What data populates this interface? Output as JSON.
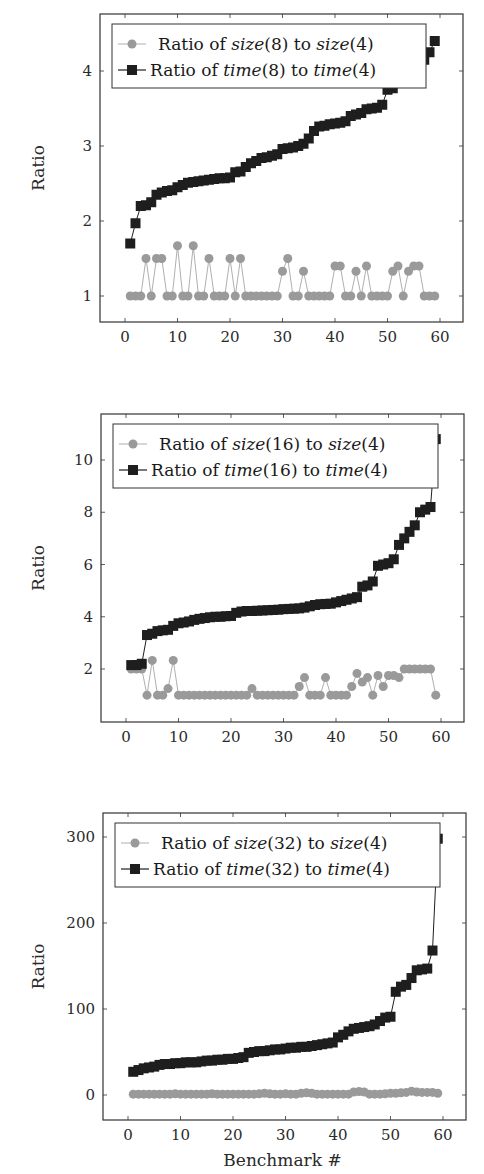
{
  "colors": {
    "size_series": "#9a9a9a",
    "time_series": "#1e1e1e",
    "frame": "#333333",
    "legend_border": "#333333"
  },
  "chart_data": [
    {
      "type": "line",
      "title": "",
      "xlabel": "",
      "ylabel": "Ratio",
      "xlim": [
        -5,
        65
      ],
      "ylim": [
        0.65,
        4.75
      ],
      "xticks": [
        0,
        10,
        20,
        30,
        40,
        50,
        60
      ],
      "yticks": [
        1,
        2,
        3,
        4
      ],
      "grid": false,
      "legend_position": "upper left",
      "x": [
        1,
        2,
        3,
        4,
        5,
        6,
        7,
        8,
        9,
        10,
        11,
        12,
        13,
        14,
        15,
        16,
        17,
        18,
        19,
        20,
        21,
        22,
        23,
        24,
        25,
        26,
        27,
        28,
        29,
        30,
        31,
        32,
        33,
        34,
        35,
        36,
        37,
        38,
        39,
        40,
        41,
        42,
        43,
        44,
        45,
        46,
        47,
        48,
        49,
        50,
        51,
        52,
        53,
        54,
        55,
        56,
        57,
        58,
        59
      ],
      "series": [
        {
          "name": "Ratio of size(8) to size(4)",
          "legend": {
            "pre": "Ratio of ",
            "a": "size",
            "a_arg": "(8)",
            "mid": " to ",
            "b": "size",
            "b_arg": "(4)"
          },
          "marker": "circle",
          "values": [
            1,
            1,
            1,
            1.5,
            1,
            1.5,
            1.5,
            1,
            1,
            1.67,
            1,
            1,
            1.67,
            1,
            1,
            1.5,
            1,
            1,
            1,
            1.5,
            1,
            1.5,
            1,
            1,
            1,
            1,
            1,
            1,
            1,
            1.33,
            1.5,
            1,
            1,
            1.33,
            1,
            1,
            1,
            1,
            1,
            1.4,
            1.4,
            1,
            1,
            1.33,
            1,
            1.4,
            1,
            1,
            1,
            1,
            1.33,
            1.4,
            1,
            1.33,
            1.4,
            1.4,
            1,
            1,
            1
          ]
        },
        {
          "name": "Ratio of time(8) to time(4)",
          "legend": {
            "pre": "Ratio of ",
            "a": "time",
            "a_arg": "(8)",
            "mid": " to ",
            "b": "time",
            "b_arg": "(4)"
          },
          "marker": "square",
          "values": [
            1.7,
            1.97,
            2.2,
            2.21,
            2.25,
            2.35,
            2.38,
            2.4,
            2.41,
            2.45,
            2.48,
            2.51,
            2.52,
            2.53,
            2.54,
            2.55,
            2.56,
            2.57,
            2.57,
            2.58,
            2.65,
            2.66,
            2.72,
            2.77,
            2.8,
            2.84,
            2.85,
            2.87,
            2.89,
            2.96,
            2.97,
            2.98,
            3.0,
            3.03,
            3.1,
            3.2,
            3.26,
            3.27,
            3.29,
            3.3,
            3.31,
            3.33,
            3.4,
            3.42,
            3.44,
            3.49,
            3.5,
            3.51,
            3.55,
            3.75,
            3.77,
            3.95,
            4.0,
            4.05,
            4.08,
            4.1,
            4.15,
            4.25,
            4.4
          ]
        }
      ]
    },
    {
      "type": "line",
      "title": "",
      "xlabel": "",
      "ylabel": "Ratio",
      "xlim": [
        -5,
        65
      ],
      "ylim": [
        0.0,
        11.8
      ],
      "xticks": [
        0,
        10,
        20,
        30,
        40,
        50,
        60
      ],
      "yticks": [
        2,
        4,
        6,
        8,
        10
      ],
      "grid": false,
      "legend_position": "upper left",
      "x": [
        1,
        2,
        3,
        4,
        5,
        6,
        7,
        8,
        9,
        10,
        11,
        12,
        13,
        14,
        15,
        16,
        17,
        18,
        19,
        20,
        21,
        22,
        23,
        24,
        25,
        26,
        27,
        28,
        29,
        30,
        31,
        32,
        33,
        34,
        35,
        36,
        37,
        38,
        39,
        40,
        41,
        42,
        43,
        44,
        45,
        46,
        47,
        48,
        49,
        50,
        51,
        52,
        53,
        54,
        55,
        56,
        57,
        58,
        59
      ],
      "series": [
        {
          "name": "Ratio of size(16) to size(4)",
          "legend": {
            "pre": "Ratio of ",
            "a": "size",
            "a_arg": "(16)",
            "mid": " to ",
            "b": "size",
            "b_arg": "(4)"
          },
          "marker": "circle",
          "values": [
            2,
            2,
            2,
            1,
            2.33,
            1,
            1,
            1.25,
            2.33,
            1,
            1,
            1,
            1,
            1,
            1,
            1,
            1,
            1,
            1,
            1,
            1,
            1,
            1,
            1.25,
            1,
            1,
            1,
            1,
            1,
            1,
            1,
            1,
            1.33,
            1.67,
            1,
            1,
            1,
            1.67,
            1,
            1,
            1,
            1,
            1.33,
            1.83,
            1.5,
            1.67,
            1,
            1.75,
            1.33,
            1.75,
            1.75,
            1.67,
            2,
            2,
            2,
            2,
            2,
            2,
            1
          ]
        },
        {
          "name": "Ratio of time(16) to time(4)",
          "legend": {
            "pre": "Ratio of ",
            "a": "time",
            "a_arg": "(16)",
            "mid": " to ",
            "b": "time",
            "b_arg": "(4)"
          },
          "marker": "square",
          "values": [
            2.15,
            2.15,
            2.2,
            3.3,
            3.35,
            3.45,
            3.48,
            3.5,
            3.65,
            3.75,
            3.78,
            3.82,
            3.88,
            3.92,
            3.95,
            3.98,
            4.0,
            4.0,
            4.02,
            4.03,
            4.15,
            4.2,
            4.22,
            4.22,
            4.23,
            4.24,
            4.25,
            4.26,
            4.27,
            4.29,
            4.3,
            4.31,
            4.32,
            4.35,
            4.4,
            4.45,
            4.48,
            4.49,
            4.5,
            4.55,
            4.6,
            4.65,
            4.7,
            4.75,
            5.15,
            5.2,
            5.35,
            5.95,
            6.0,
            6.05,
            6.2,
            6.75,
            7.0,
            7.25,
            7.5,
            8.0,
            8.1,
            8.2,
            10.8
          ]
        }
      ]
    },
    {
      "type": "line",
      "title": "",
      "xlabel": "Benchmark #",
      "ylabel": "Ratio",
      "xlim": [
        -5,
        65
      ],
      "ylim": [
        -30,
        325
      ],
      "xticks": [
        0,
        10,
        20,
        30,
        40,
        50,
        60
      ],
      "yticks": [
        0,
        100,
        200,
        300
      ],
      "grid": false,
      "legend_position": "upper left",
      "x": [
        1,
        2,
        3,
        4,
        5,
        6,
        7,
        8,
        9,
        10,
        11,
        12,
        13,
        14,
        15,
        16,
        17,
        18,
        19,
        20,
        21,
        22,
        23,
        24,
        25,
        26,
        27,
        28,
        29,
        30,
        31,
        32,
        33,
        34,
        35,
        36,
        37,
        38,
        39,
        40,
        41,
        42,
        43,
        44,
        45,
        46,
        47,
        48,
        49,
        50,
        51,
        52,
        53,
        54,
        55,
        56,
        57,
        58,
        59
      ],
      "series": [
        {
          "name": "Ratio of size(32) to size(4)",
          "legend": {
            "pre": "Ratio of ",
            "a": "size",
            "a_arg": "(32)",
            "mid": " to ",
            "b": "size",
            "b_arg": "(4)"
          },
          "marker": "circle",
          "values": [
            1,
            1,
            1,
            1,
            1,
            1,
            1,
            1,
            1.5,
            1,
            1,
            1,
            1,
            1,
            1,
            1.5,
            1,
            1,
            1,
            1,
            1,
            1,
            1,
            1,
            1.5,
            2,
            1.5,
            1,
            1,
            1.5,
            1,
            1,
            2,
            2.5,
            2,
            1,
            1,
            1,
            1,
            1,
            1,
            1,
            3.5,
            4,
            3.5,
            1,
            1,
            1,
            1.5,
            2,
            2,
            2.5,
            3,
            4.5,
            3.5,
            3,
            3,
            3,
            2
          ]
        },
        {
          "name": "Ratio of time(32) to time(4)",
          "legend": {
            "pre": "Ratio of ",
            "a": "time",
            "a_arg": "(32)",
            "mid": " to ",
            "b": "time",
            "b_arg": "(4)"
          },
          "marker": "square",
          "values": [
            27,
            29,
            31,
            32,
            33,
            35,
            36,
            36,
            37,
            37,
            38,
            38,
            38,
            39,
            40,
            40,
            41,
            41,
            42,
            42,
            43,
            44,
            49,
            50,
            51,
            51,
            52,
            53,
            53,
            54,
            55,
            55,
            56,
            56,
            57,
            58,
            59,
            60,
            61,
            67,
            70,
            74,
            77,
            78,
            79,
            80,
            82,
            86,
            90,
            91,
            120,
            126,
            128,
            136,
            145,
            146,
            147,
            168,
            298
          ]
        }
      ]
    }
  ]
}
